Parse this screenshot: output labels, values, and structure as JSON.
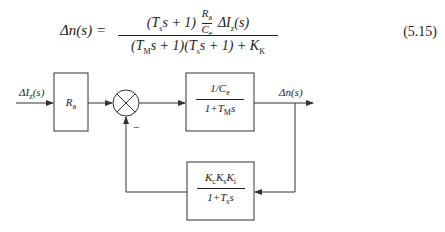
{
  "equation": {
    "lhs": "Δn(s) =",
    "numerator_prefix": "(T",
    "numerator_prefix_sub": "s",
    "numerator_prefix_rest": "s + 1)",
    "inner_fraction_num": "R",
    "inner_fraction_num_sub": "a",
    "inner_fraction_den": "C",
    "inner_fraction_den_sub": "e",
    "numerator_suffix": "ΔI",
    "numerator_suffix_sub": "z",
    "numerator_suffix_rest": "(s)",
    "denominator": {
      "p1": "(T",
      "p1_sub": "M",
      "p2": "s + 1)(T",
      "p2_sub": "s",
      "p3": "s + 1) + K",
      "p3_sub": "K"
    },
    "number": "(5.15)"
  },
  "diagram": {
    "input_label": {
      "main": "ΔI",
      "sub": "z",
      "rest": "(s)"
    },
    "input_block": {
      "main": "R",
      "sub": "a"
    },
    "summing_junction": {
      "symbol": "⊗",
      "feedback_sign": "−"
    },
    "forward_block": {
      "numerator": {
        "main": "1/C",
        "sub": "e"
      },
      "denominator": {
        "main": "1+T",
        "sub": "M",
        "rest": "s"
      }
    },
    "output_label": "Δn(s)",
    "feedback_block": {
      "numerator": {
        "k1": "K",
        "k1_sub": "c",
        "k2": "K",
        "k2_sub": "s",
        "k3": "K",
        "k3_sub": "i"
      },
      "denominator": {
        "main": "1+T",
        "sub": "s",
        "rest": "s"
      }
    },
    "line_color": "#333333"
  }
}
